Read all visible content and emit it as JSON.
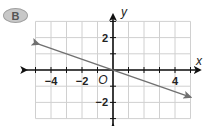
{
  "badge": {
    "label": "B"
  },
  "colors": {
    "grid": "#d0d0d0",
    "axis": "#111111",
    "line": "#707070",
    "text": "#222222"
  },
  "chart_data": {
    "type": "line",
    "title": "",
    "xlabel": "x",
    "ylabel": "y",
    "origin_label": "O",
    "xlim": [
      -5,
      5
    ],
    "ylim": [
      -3,
      3
    ],
    "grid": true,
    "x_ticks": [
      -4,
      -2,
      2,
      4
    ],
    "x_tick_labels": [
      "−4",
      "−2",
      "",
      "4"
    ],
    "y_ticks": [
      2,
      -2
    ],
    "y_tick_labels": [
      "2",
      "−2"
    ],
    "series": [
      {
        "name": "y = -x/3",
        "equation": "y = -1/3 x",
        "slope": -0.3333,
        "intercept": 0,
        "points": [
          [
            -4.8,
            1.6
          ],
          [
            0,
            0
          ],
          [
            3,
            -1
          ],
          [
            5,
            -1.67
          ]
        ],
        "arrows": "both"
      }
    ]
  }
}
